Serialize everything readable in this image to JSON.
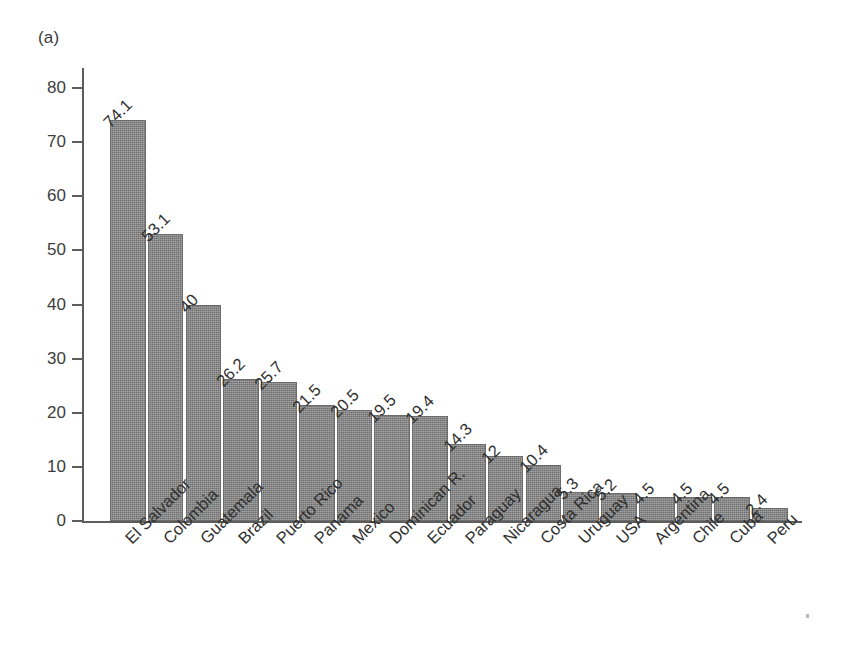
{
  "panel": {
    "label": "(a)"
  },
  "chart_data": {
    "type": "bar",
    "title": "",
    "subtitle": "",
    "xlabel": "",
    "ylabel": "",
    "panel_label": "(a)",
    "categories": [
      "El Salvador",
      "Colombia",
      "Guatemala",
      "Brazil",
      "Puerto Rico",
      "Panama",
      "Mexico",
      "Dominican R.",
      "Ecuador",
      "Paraguay",
      "Nicaragua",
      "Costa Rica",
      "Uruguay",
      "USA",
      "Argentina",
      "Chile",
      "Cuba",
      "Peru"
    ],
    "values": [
      74.1,
      53.1,
      40,
      26.2,
      25.7,
      21.5,
      20.5,
      19.5,
      19.4,
      14.3,
      12,
      10.4,
      5.3,
      5.2,
      4.5,
      4.5,
      4.5,
      2.4
    ],
    "value_labels": [
      "74.1",
      "53.1",
      "40",
      "26.2",
      "25.7",
      "21.5",
      "20.5",
      "19.5",
      "19.4",
      "14.3",
      "12",
      "10.4",
      "5.3",
      "5.2",
      "4.5",
      "4.5",
      "4.5",
      "2.4"
    ],
    "ylim": [
      0,
      80
    ],
    "ytick_values": [
      0,
      10,
      20,
      30,
      40,
      50,
      60,
      70,
      80
    ],
    "ytick_labels": [
      "0",
      "10",
      "20",
      "30",
      "40",
      "50",
      "60",
      "70",
      "80"
    ],
    "grid": false,
    "legend": null,
    "bar_color": "#7e7e7e",
    "axis_color": "#5d5d5d",
    "text_color": "#303030",
    "annotations": []
  }
}
